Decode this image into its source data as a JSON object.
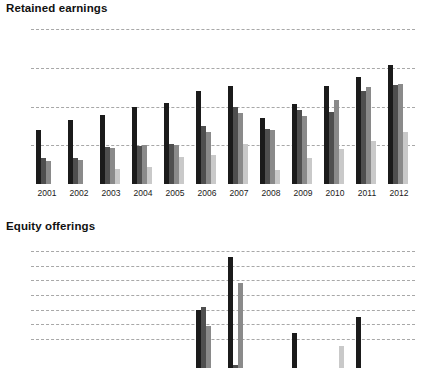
{
  "page": {
    "background": "#ffffff"
  },
  "panels": [
    {
      "id": "retained-earnings",
      "title": "Retained earnings"
    },
    {
      "id": "equity-offerings",
      "title": "Equity offerings"
    }
  ],
  "colors": {
    "series1": "#1b1b1b",
    "series2": "#4f4f4f",
    "series3": "#8a8a8a",
    "series4": "#c9c9c9",
    "gridline": "#9a9a9a",
    "axis": "#111111",
    "text": "#1a1a1a"
  },
  "chart_data": [
    {
      "type": "bar",
      "title": "Retained earnings",
      "xlabel": "",
      "ylabel": "",
      "ylim": [
        0,
        400
      ],
      "yticks": [
        0,
        100,
        200,
        300,
        400
      ],
      "ytick_labels": [
        "0",
        "100",
        "200",
        "300",
        "400"
      ],
      "grid": true,
      "legend": "none",
      "categories": [
        "2001",
        "2002",
        "2003",
        "2004",
        "2005",
        "2006",
        "2007",
        "2008",
        "2009",
        "2010",
        "2011",
        "2012"
      ],
      "series": [
        {
          "name": "series-1",
          "color": "#1b1b1b",
          "values": [
            140,
            166,
            178,
            200,
            209,
            239,
            253,
            170,
            207,
            254,
            276,
            307
          ]
        },
        {
          "name": "series-2",
          "color": "#4f4f4f",
          "values": [
            66,
            68,
            96,
            99,
            104,
            150,
            200,
            141,
            192,
            185,
            240,
            255
          ]
        },
        {
          "name": "series-3",
          "color": "#8a8a8a",
          "values": [
            60,
            62,
            92,
            100,
            101,
            133,
            182,
            140,
            175,
            216,
            250,
            258
          ]
        },
        {
          "name": "series-4",
          "color": "#c9c9c9",
          "values": [
            null,
            null,
            39,
            45,
            71,
            74,
            104,
            35,
            68,
            90,
            110,
            135
          ]
        }
      ]
    },
    {
      "type": "bar",
      "title": "Equity offerings",
      "xlabel": "",
      "ylabel": "",
      "ylim": [
        0,
        85
      ],
      "yticks": [
        20,
        30,
        40,
        50,
        60,
        70,
        80
      ],
      "ytick_labels": [
        "20",
        "30",
        "40",
        "50",
        "60",
        "70",
        "80"
      ],
      "grid": true,
      "legend": "none",
      "cropped_bottom": true,
      "categories": [
        "2001",
        "2002",
        "2003",
        "2004",
        "2005",
        "2006",
        "2007",
        "2008",
        "2009",
        "2010",
        "2011",
        "2012"
      ],
      "series": [
        {
          "name": "series-1",
          "color": "#1b1b1b",
          "values": [
            0,
            0,
            0,
            0,
            0,
            40,
            76,
            0,
            24,
            0,
            35,
            0
          ]
        },
        {
          "name": "series-2",
          "color": "#4f4f4f",
          "values": [
            0,
            0,
            0,
            0,
            0,
            42,
            2,
            0,
            0,
            0,
            0,
            0
          ]
        },
        {
          "name": "series-3",
          "color": "#8a8a8a",
          "values": [
            0,
            0,
            0,
            0,
            0,
            29,
            58,
            0,
            0,
            0,
            0,
            0
          ]
        },
        {
          "name": "series-4",
          "color": "#c9c9c9",
          "values": [
            0,
            0,
            0,
            0,
            0,
            0,
            0,
            0,
            0,
            15,
            0,
            0
          ]
        }
      ]
    }
  ]
}
